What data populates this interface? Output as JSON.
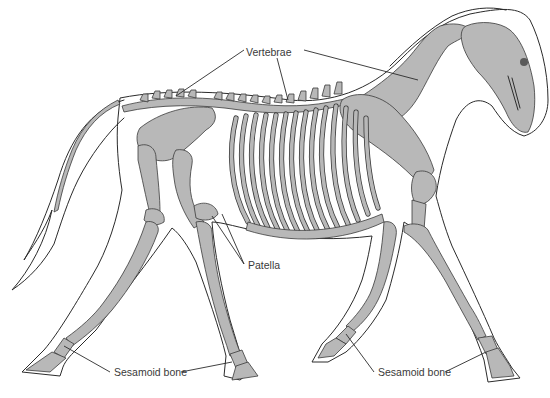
{
  "figure": {
    "background_color": "#ffffff",
    "bone_color": "#b8b8b8",
    "outline_color": "#2b2b2b",
    "label_color": "#3a3a3a"
  },
  "labels": [
    {
      "id": "vertebrae",
      "text": "Vertebrae",
      "x": 246,
      "y": 46
    },
    {
      "id": "patella",
      "text": "Patella",
      "x": 248,
      "y": 259
    },
    {
      "id": "sesamoid-hind",
      "text": "Sesamoid bone",
      "x": 114,
      "y": 366
    },
    {
      "id": "sesamoid-fore",
      "text": "Sesamoid bone",
      "x": 378,
      "y": 366
    }
  ],
  "leaders": {
    "vertebrae": [
      "tail/lumbar region",
      "thoracic spine",
      "cervical spine"
    ],
    "patella": [
      "left stifle",
      "right stifle"
    ],
    "sesamoid-hind": "hind fetlock",
    "sesamoid-fore": "fore fetlock"
  }
}
